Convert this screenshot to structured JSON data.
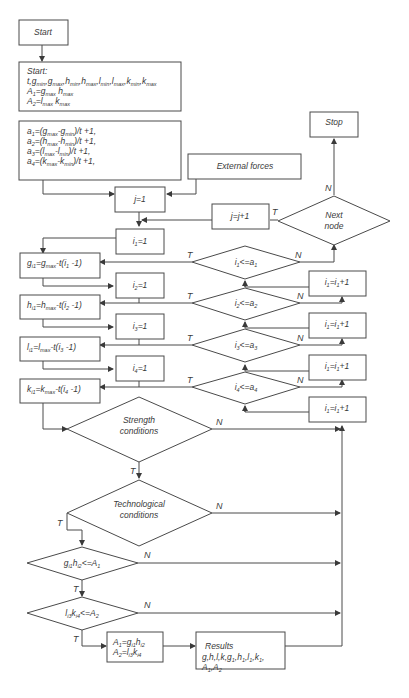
{
  "diagram": {
    "type": "flowchart",
    "nodes": {
      "start": "Start",
      "init_title": "Start:",
      "init_line1": "t,gmin,gmax,hmin,hmax,lmin,lmax,kmin,kmax",
      "init_line2": "A1=gmax hmax",
      "init_line3": "A2=lmax kmax",
      "a1": "a1=(gmax-gmin)/t +1,",
      "a2": "a2=(hmax-hmin)/t +1,",
      "a3": "a3=(lmax-lmin)/t +1,",
      "a4": "a4=(kmax-kmin)/t +1,",
      "external_forces": "External forces",
      "stop": "Stop",
      "j_init": "j=1",
      "j_inc": "j=j+1",
      "next_node_1": "Next",
      "next_node_2": "node",
      "i1_init": "i1=1",
      "i2_init": "i2=1",
      "i3_init": "i3=1",
      "i4_init": "i4=1",
      "g_assign": "gi1=gmax-t(i1 -1)",
      "h_assign": "hi1=hmax-t(i2 -1)",
      "l_assign": "li1=lmax-t(i3 -1)",
      "k_assign": "ki1=kmax-t(i4 -1)",
      "cond_i1": "i1<=a1",
      "cond_i2": "i2<=a2",
      "cond_i3": "i3<=a3",
      "cond_i4": "i4<=a4",
      "inc_1": "i1=i1+1",
      "inc_2": "i1=i1+1",
      "inc_3": "i1=i1+1",
      "inc_4": "i1=i1+1",
      "strength_1": "Strength",
      "strength_2": "conditions",
      "tech_1": "Technological",
      "tech_2": "conditions",
      "cond_A1": "gi1hi2<=A1",
      "cond_A2": "li3ki4<=A2",
      "update_1": "A1=gi1hi2",
      "update_2": "A2=li3ki4",
      "results_1": "Results",
      "results_2": "g,h,l,k,g1,h1,l1,k1,",
      "results_3": "A1,A2"
    },
    "edge_labels": {
      "true": "T",
      "false": "N"
    },
    "colors": {
      "stroke": "#4a4a4a",
      "text": "#3a3a3a",
      "background": "#ffffff"
    }
  }
}
